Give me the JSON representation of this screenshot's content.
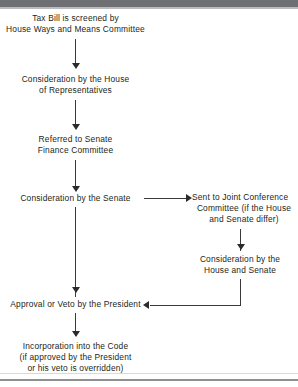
{
  "diagram": {
    "type": "flowchart",
    "title_text": "Legislative process for a tax bill",
    "orientation": "top-to-bottom with branch",
    "colors": {
      "text": "#231f20",
      "connector": "#3a3a3c",
      "background": "#ffffff",
      "scan_bar": "#6f7073"
    },
    "nodes": [
      {
        "id": "n1",
        "lines": [
          "Tax Bill is screened by",
          "House Ways and Means Committee"
        ],
        "column": "main"
      },
      {
        "id": "n2",
        "lines": [
          "Consideration by the House",
          "of Representatives"
        ],
        "column": "main"
      },
      {
        "id": "n3",
        "lines": [
          "Referred to Senate",
          "Finance Committee"
        ],
        "column": "main"
      },
      {
        "id": "n4",
        "lines": [
          "Consideration by the Senate"
        ],
        "column": "main"
      },
      {
        "id": "n5",
        "lines": [
          "Sent to Joint Conference",
          "Committee (if the House",
          "and Senate differ)"
        ],
        "column": "branch"
      },
      {
        "id": "n6",
        "lines": [
          "Consideration by the",
          "House and Senate"
        ],
        "column": "branch"
      },
      {
        "id": "n7",
        "lines": [
          "Approval or Veto by the President"
        ],
        "column": "main"
      },
      {
        "id": "n8",
        "lines": [
          "Incorporation into the Code",
          "(if approved by the President",
          "or his veto is overridden)"
        ],
        "column": "main"
      }
    ],
    "edges": [
      {
        "id": "e1",
        "from": "n1",
        "to": "n2",
        "direction": "down"
      },
      {
        "id": "e2",
        "from": "n2",
        "to": "n3",
        "direction": "down"
      },
      {
        "id": "e3",
        "from": "n3",
        "to": "n4",
        "direction": "down"
      },
      {
        "id": "e4",
        "from": "n4",
        "to": "n5",
        "direction": "right"
      },
      {
        "id": "e5",
        "from": "n5",
        "to": "n6",
        "direction": "down"
      },
      {
        "id": "e6",
        "from": "n4",
        "to": "n7",
        "direction": "down"
      },
      {
        "id": "e7",
        "from": "n6",
        "to": "n7",
        "direction": "left",
        "routing": "down-then-left"
      },
      {
        "id": "e8",
        "from": "n7",
        "to": "n8",
        "direction": "down"
      }
    ]
  }
}
